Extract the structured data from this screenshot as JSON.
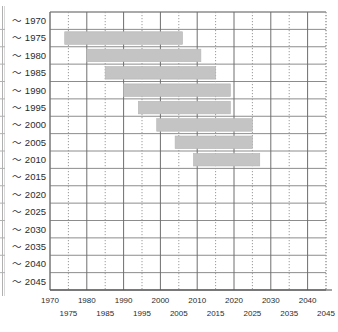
{
  "chart_data": {
    "type": "bar",
    "orientation": "horizontal",
    "title": "",
    "xlabel": "",
    "ylabel": "",
    "xlim": [
      1970,
      2045
    ],
    "grid": true,
    "legend": false,
    "categories": [
      "〜 1970",
      "〜 1975",
      "〜 1980",
      "〜 1985",
      "〜 1990",
      "〜 1995",
      "〜 2000",
      "〜 2005",
      "〜 2010",
      "〜 2015",
      "〜 2020",
      "〜 2025",
      "〜 2030",
      "〜 2035",
      "〜 2040",
      "〜 2045"
    ],
    "x_major_ticks": [
      1970,
      1980,
      1990,
      2000,
      2010,
      2020,
      2030,
      2040
    ],
    "x_minor_ticks": [
      1975,
      1985,
      1995,
      2005,
      2015,
      2025,
      2035,
      2045
    ],
    "x_tick_labels_upper": [
      "1970",
      "1980",
      "1990",
      "2000",
      "2010",
      "2020",
      "2030",
      "2040"
    ],
    "x_tick_labels_lower": [
      "1975",
      "1985",
      "1995",
      "2005",
      "2015",
      "2025",
      "2035",
      "2045"
    ],
    "bars": [
      {
        "category": "〜 1970",
        "start": null,
        "end": null
      },
      {
        "category": "〜 1975",
        "start": 1974,
        "end": 2006
      },
      {
        "category": "〜 1980",
        "start": 1980,
        "end": 2011
      },
      {
        "category": "〜 1985",
        "start": 1985,
        "end": 2015
      },
      {
        "category": "〜 1990",
        "start": 1990,
        "end": 2019
      },
      {
        "category": "〜 1995",
        "start": 1994,
        "end": 2019
      },
      {
        "category": "〜 2000",
        "start": 1999,
        "end": 2025
      },
      {
        "category": "〜 2005",
        "start": 2004,
        "end": 2025
      },
      {
        "category": "〜 2010",
        "start": 2009,
        "end": 2027
      },
      {
        "category": "〜 2015",
        "start": null,
        "end": null
      },
      {
        "category": "〜 2020",
        "start": null,
        "end": null
      },
      {
        "category": "〜 2025",
        "start": null,
        "end": null
      },
      {
        "category": "〜 2030",
        "start": null,
        "end": null
      },
      {
        "category": "〜 2035",
        "start": null,
        "end": null
      },
      {
        "category": "〜 2040",
        "start": null,
        "end": null
      },
      {
        "category": "〜 2045",
        "start": null,
        "end": null
      }
    ],
    "colors": {
      "bar_fill": "#c4c4c4",
      "bar_stroke": "#b5b5b5",
      "grid_major": "#6e6e6e",
      "grid_minor": "#9a9a9a",
      "row_line": "#8c8c8c",
      "plot_border": "#7a7a7a",
      "text": "#2b2b2b",
      "background": "#ffffff"
    }
  },
  "layout": {
    "plot_left": 50,
    "plot_right": 326,
    "plot_top": 12,
    "plot_bottom": 290,
    "row_height": 17.375
  }
}
